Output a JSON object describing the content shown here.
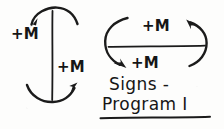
{
  "figure": {
    "title_lines": [
      "Signs -",
      "Program I"
    ],
    "ink_color": "#1b1b1b",
    "background_color": "#fdfdfc",
    "diagrams": [
      {
        "name": "vertical-member-moment-diagram",
        "member_orientation": "vertical",
        "labels": [
          {
            "text": "+M",
            "position": "upper-left",
            "arrow": "top-arc-arrowhead-pointing-down-left"
          },
          {
            "text": "+M",
            "position": "lower-right",
            "arrow": "bottom-arc-arrowhead-pointing-up-right"
          }
        ]
      },
      {
        "name": "horizontal-member-moment-diagram",
        "member_orientation": "horizontal",
        "labels": [
          {
            "text": "+M",
            "position": "upper-right",
            "arrow": "right-arc-arrowhead-pointing-up-left"
          },
          {
            "text": "+M",
            "position": "lower-left",
            "arrow": "left-arc-arrowhead-pointing-down-right"
          }
        ]
      }
    ]
  },
  "labels": {
    "left_figure_upper": "+M",
    "left_figure_lower": "+M",
    "right_figure_upper": "+M",
    "right_figure_lower": "+M"
  },
  "caption": {
    "line1": "Signs -",
    "line2": "Program I"
  }
}
